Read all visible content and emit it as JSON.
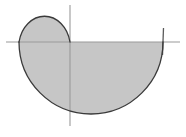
{
  "figure": {
    "title": "",
    "caption": "",
    "background_color": "#ffffff",
    "width": 186,
    "height": 137
  },
  "axes": {
    "x_axis": {
      "label": "",
      "color": "#9a9a9a",
      "stroke_width": 1.1,
      "y_pixel": 42,
      "x_start_pixel": 6,
      "x_end_pixel": 180
    },
    "y_axis": {
      "label": "",
      "color": "#9a9a9a",
      "stroke_width": 1.1,
      "x_pixel": 70,
      "y_start_pixel": 5,
      "y_end_pixel": 126
    },
    "origin_pixel": {
      "x": 70,
      "y": 42
    },
    "end_tick": {
      "name": "right-axis-tick",
      "x_pixel": 163,
      "y_top_pixel": 28,
      "y_bottom_pixel": 55,
      "color": "#5a5a5a",
      "stroke_width": 1.3
    }
  },
  "region": {
    "name": "shaded-polar-region",
    "fill_color": "#c6c6c6",
    "stroke_color": "#3a3a3a",
    "stroke_width": 1.3,
    "description": "Shaded region bounded by a large semicircular arc below the horizontal axis and a smaller lobe above it on the left",
    "large_lobe": {
      "center_pixel": {
        "x": 91,
        "y": 42
      },
      "radius_pixel": 72,
      "span": "lower half-plane, from left endpoint to right endpoint on the x-axis",
      "left_endpoint_pixel": {
        "x": 19,
        "y": 42
      },
      "right_endpoint_pixel": {
        "x": 163,
        "y": 42
      },
      "bottom_pixel": {
        "x": 91,
        "y": 112
      }
    },
    "small_lobe": {
      "center_pixel": {
        "x": 44,
        "y": 42
      },
      "radius_x_pixel": 26,
      "radius_y_pixel": 32,
      "span": "upper half-plane, left of the vertical axis",
      "left_endpoint_pixel": {
        "x": 19,
        "y": 42
      },
      "right_endpoint_pixel": {
        "x": 70,
        "y": 42
      },
      "top_pixel": {
        "x": 44,
        "y": 10
      }
    },
    "path_d": "M 19 42 C 19 20 31 10 45 10 C 60 10 70 22 70 42 L 19 42 Z"
  },
  "chart_data": {
    "type": "line",
    "title": "",
    "xlabel": "",
    "ylabel": "",
    "grid": false,
    "legend": "none",
    "curves": [
      {
        "name": "large-semicircle",
        "shape": "semicircle",
        "center": [
          91,
          42
        ],
        "radius": 72,
        "half": "lower"
      },
      {
        "name": "small-lobe",
        "shape": "half-ellipse",
        "center": [
          44,
          42
        ],
        "radius_x": 26,
        "radius_y": 32,
        "half": "upper"
      }
    ],
    "shaded": true,
    "shaded_fill": "#c6c6c6"
  }
}
